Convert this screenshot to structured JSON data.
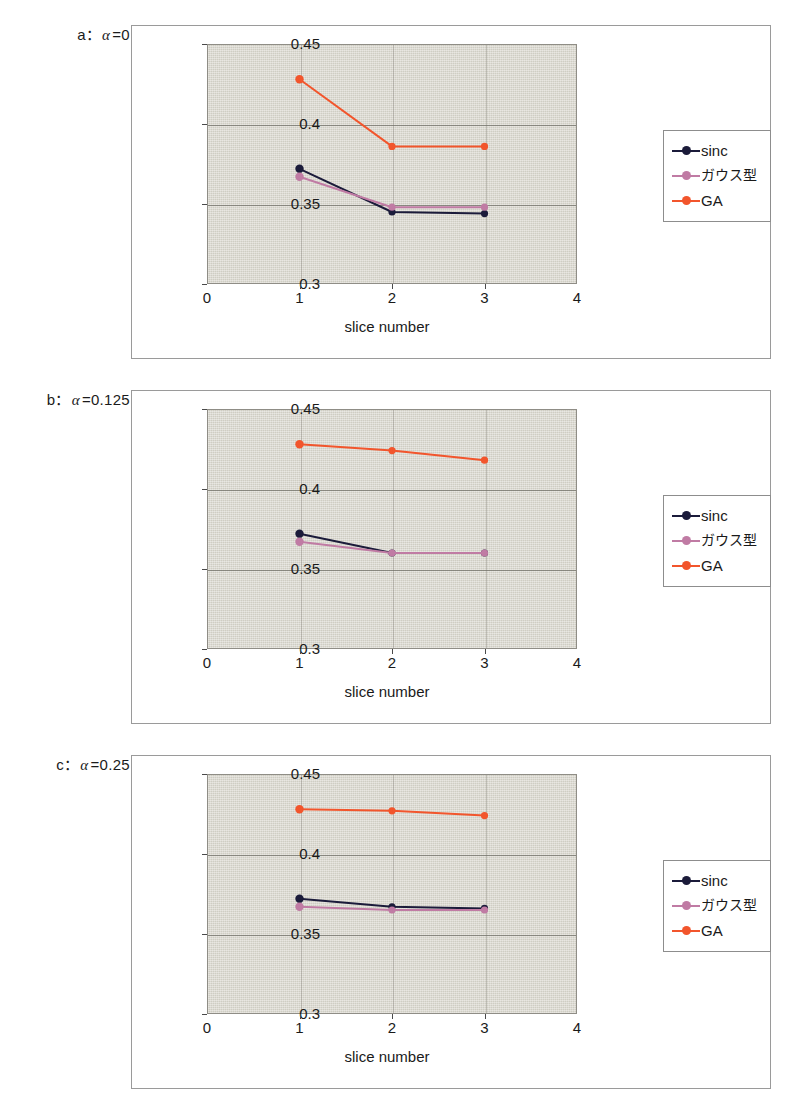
{
  "figure": {
    "panels": [
      {
        "id": "a",
        "letter": "a",
        "separator": "：",
        "alpha": "α",
        "equals": "=",
        "alpha_value": "0",
        "caption_full": "a： α = 0",
        "chart_data": {
          "type": "line",
          "title": "",
          "xlabel": "slice number",
          "ylabel": "signal intensity (a.u.)",
          "x": [
            1,
            2,
            3
          ],
          "xlim": [
            0,
            4
          ],
          "ylim": [
            0.3,
            0.45
          ],
          "xticks": [
            "0",
            "1",
            "2",
            "3",
            "4"
          ],
          "yticks": [
            "0.3",
            "0.35",
            "0.4",
            "0.45"
          ],
          "grid": "horizontal",
          "legend_position": "right-outside",
          "series": [
            {
              "name": "sinc",
              "color": "#1b1b3a",
              "values": [
                0.372,
                0.345,
                0.344
              ]
            },
            {
              "name": "ガウス型",
              "color": "#c07ba4",
              "values": [
                0.367,
                0.348,
                0.348
              ]
            },
            {
              "name": "GA",
              "color": "#f2552c",
              "values": [
                0.428,
                0.386,
                0.386
              ]
            }
          ]
        }
      },
      {
        "id": "b",
        "letter": "b",
        "separator": "：",
        "alpha": "α",
        "equals": "=",
        "alpha_value": "0.125",
        "caption_full": "b： α = 0.125",
        "chart_data": {
          "type": "line",
          "title": "",
          "xlabel": "slice number",
          "ylabel": "signal intensity (a.u.)",
          "x": [
            1,
            2,
            3
          ],
          "xlim": [
            0,
            4
          ],
          "ylim": [
            0.3,
            0.45
          ],
          "xticks": [
            "0",
            "1",
            "2",
            "3",
            "4"
          ],
          "yticks": [
            "0.3",
            "0.35",
            "0.4",
            "0.45"
          ],
          "grid": "horizontal",
          "legend_position": "right-outside",
          "series": [
            {
              "name": "sinc",
              "color": "#1b1b3a",
              "values": [
                0.372,
                0.36,
                0.36
              ]
            },
            {
              "name": "ガウス型",
              "color": "#c07ba4",
              "values": [
                0.367,
                0.36,
                0.36
              ]
            },
            {
              "name": "GA",
              "color": "#f2552c",
              "values": [
                0.428,
                0.424,
                0.418
              ]
            }
          ]
        }
      },
      {
        "id": "c",
        "letter": "c",
        "separator": "：",
        "alpha": "α",
        "equals": "=",
        "alpha_value": "0.25",
        "caption_full": "c： α = 0.25",
        "chart_data": {
          "type": "line",
          "title": "",
          "xlabel": "slice number",
          "ylabel": "signal intensity (a.u.)",
          "x": [
            1,
            2,
            3
          ],
          "xlim": [
            0,
            4
          ],
          "ylim": [
            0.3,
            0.45
          ],
          "xticks": [
            "0",
            "1",
            "2",
            "3",
            "4"
          ],
          "yticks": [
            "0.3",
            "0.35",
            "0.4",
            "0.45"
          ],
          "grid": "horizontal",
          "legend_position": "right-outside",
          "series": [
            {
              "name": "sinc",
              "color": "#1b1b3a",
              "values": [
                0.372,
                0.367,
                0.366
              ]
            },
            {
              "name": "ガウス型",
              "color": "#c07ba4",
              "values": [
                0.367,
                0.365,
                0.365
              ]
            },
            {
              "name": "GA",
              "color": "#f2552c",
              "values": [
                0.428,
                0.427,
                0.424
              ]
            }
          ]
        }
      }
    ],
    "colors": {
      "plot_background": "#d5d3c9",
      "panel_border": "#9a9a9a",
      "gridline": "#6f6d66",
      "sinc": "#1b1b3a",
      "gauss": "#c07ba4",
      "ga": "#f2552c"
    }
  }
}
